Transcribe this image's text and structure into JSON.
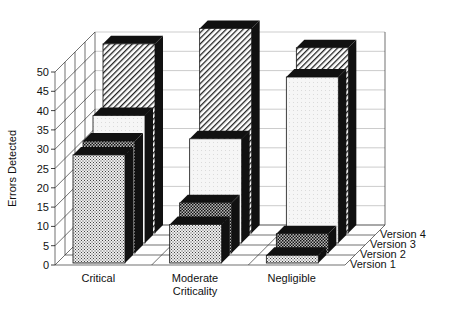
{
  "chart_data": {
    "type": "bar",
    "subtype": "3d-grouped",
    "title": "",
    "xlabel": "",
    "ylabel": "Errors Detected",
    "ylim": [
      0,
      50
    ],
    "yticks": [
      0,
      5,
      10,
      15,
      20,
      25,
      30,
      35,
      40,
      45,
      50
    ],
    "categories": [
      "Critical",
      "Moderate Criticality",
      "Negligible"
    ],
    "category_labels": [
      [
        "Critical"
      ],
      [
        "Moderate",
        "Criticality"
      ],
      [
        "Negligible"
      ]
    ],
    "series": [
      {
        "name": "Version 1",
        "values": [
          28,
          10,
          2
        ]
      },
      {
        "name": "Version 2",
        "values": [
          29,
          13,
          5
        ]
      },
      {
        "name": "Version 3",
        "values": [
          33,
          27,
          43
        ]
      },
      {
        "name": "Version 4",
        "values": [
          49,
          53,
          48
        ]
      }
    ],
    "grid": true,
    "legend_position": "depth-axis-right"
  }
}
